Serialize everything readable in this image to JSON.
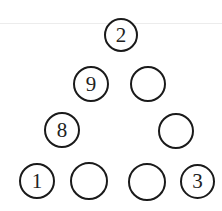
{
  "diagram": {
    "type": "number-triangle-puzzle",
    "nodes": [
      {
        "id": "top",
        "value": "2",
        "cx": 121,
        "cy": 35
      },
      {
        "id": "left-2",
        "value": "9",
        "cx": 91,
        "cy": 84
      },
      {
        "id": "right-2",
        "value": "",
        "cx": 148,
        "cy": 84
      },
      {
        "id": "left-3",
        "value": "8",
        "cx": 62,
        "cy": 130
      },
      {
        "id": "right-3",
        "value": "",
        "cx": 176,
        "cy": 131
      },
      {
        "id": "bottom-1",
        "value": "1",
        "cx": 37,
        "cy": 181
      },
      {
        "id": "bottom-2",
        "value": "",
        "cx": 89,
        "cy": 181
      },
      {
        "id": "bottom-3",
        "value": "",
        "cx": 147,
        "cy": 182
      },
      {
        "id": "bottom-4",
        "value": "3",
        "cx": 197,
        "cy": 182
      }
    ]
  }
}
